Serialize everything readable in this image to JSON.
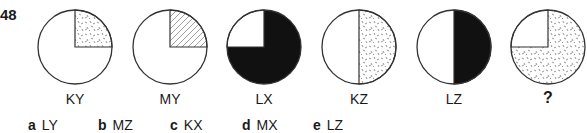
{
  "question": {
    "number": "48",
    "figures": [
      {
        "label": "KY",
        "pattern": "quarter-top-right-speckle",
        "cx": 75
      },
      {
        "label": "MY",
        "pattern": "quarter-top-right-hatch",
        "cx": 170
      },
      {
        "label": "LX",
        "pattern": "three-quarters-black-top-left-white",
        "cx": 264
      },
      {
        "label": "KZ",
        "pattern": "right-half-speckle",
        "cx": 359
      },
      {
        "label": "LZ",
        "pattern": "right-half-black",
        "cx": 454
      },
      {
        "label": "?",
        "pattern": "three-quarters-speckle-top-left-white",
        "cx": 548
      }
    ],
    "options": [
      {
        "letter": "a",
        "text": "LY"
      },
      {
        "letter": "b",
        "text": "MZ"
      },
      {
        "letter": "c",
        "text": "KX"
      },
      {
        "letter": "d",
        "text": "MX"
      },
      {
        "letter": "e",
        "text": "LZ"
      }
    ]
  },
  "colors": {
    "stroke": "#333333",
    "fill_black": "#111111",
    "hatch": "#888888"
  }
}
